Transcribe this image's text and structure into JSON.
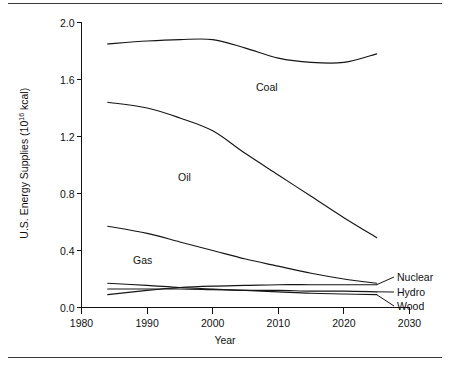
{
  "chart_data": {
    "type": "line",
    "title": "",
    "xlabel": "Year",
    "ylabel": "U.S. Energy Supplies",
    "ylabel_unit_base": "(10",
    "ylabel_unit_exp": "16",
    "ylabel_unit_tail": " kcal)",
    "ylabel_full": "U.S. Energy Supplies (10^16 kcal)",
    "xlim": [
      1980,
      2030
    ],
    "ylim": [
      0.0,
      2.0
    ],
    "grid": false,
    "legend_position": "inline-and-right-leader-labels",
    "xticks": [
      "1980",
      "1990",
      "2000",
      "2010",
      "2020",
      "2030"
    ],
    "xtick_values": [
      1980,
      1990,
      2000,
      2010,
      2020,
      2030
    ],
    "yticks": [
      "0.0",
      "0.4",
      "0.8",
      "1.2",
      "1.6",
      "2.0"
    ],
    "ytick_values": [
      0.0,
      0.4,
      0.8,
      1.2,
      1.6,
      2.0
    ],
    "x": [
      1984,
      1990,
      1995,
      2000,
      2005,
      2010,
      2015,
      2020,
      2025
    ],
    "series": [
      {
        "name": "Coal",
        "label_kind": "inline",
        "values": [
          1.85,
          1.87,
          1.88,
          1.88,
          1.82,
          1.75,
          1.72,
          1.72,
          1.78
        ]
      },
      {
        "name": "Oil",
        "label_kind": "inline",
        "values": [
          1.44,
          1.4,
          1.33,
          1.24,
          1.08,
          0.93,
          0.78,
          0.63,
          0.49
        ]
      },
      {
        "name": "Gas",
        "label_kind": "inline",
        "values": [
          0.57,
          0.52,
          0.46,
          0.4,
          0.34,
          0.29,
          0.24,
          0.2,
          0.17
        ]
      },
      {
        "name": "Nuclear",
        "label_kind": "leader",
        "values": [
          0.09,
          0.12,
          0.14,
          0.15,
          0.155,
          0.16,
          0.16,
          0.16,
          0.16
        ]
      },
      {
        "name": "Hydro",
        "label_kind": "leader",
        "values": [
          0.13,
          0.13,
          0.13,
          0.125,
          0.12,
          0.12,
          0.115,
          0.115,
          0.11
        ]
      },
      {
        "name": "Wood",
        "label_kind": "leader",
        "values": [
          0.17,
          0.155,
          0.14,
          0.13,
          0.12,
          0.11,
          0.1,
          0.095,
          0.09
        ]
      }
    ]
  },
  "axis": {
    "y_title_text": "U.S. Energy Supplies (10",
    "y_title_exp": "16",
    "y_title_tail": " kcal)",
    "x_title": "Year"
  },
  "inline_labels": [
    {
      "text": "Coal",
      "x": 256,
      "y": 82
    },
    {
      "text": "Oil",
      "x": 178,
      "y": 172
    },
    {
      "text": "Gas",
      "x": 133,
      "y": 255
    }
  ],
  "leader_labels": [
    {
      "text": "Nuclear",
      "x": 397,
      "y": 272
    },
    {
      "text": "Hydro",
      "x": 397,
      "y": 287
    },
    {
      "text": "Wood",
      "x": 397,
      "y": 301
    }
  ]
}
